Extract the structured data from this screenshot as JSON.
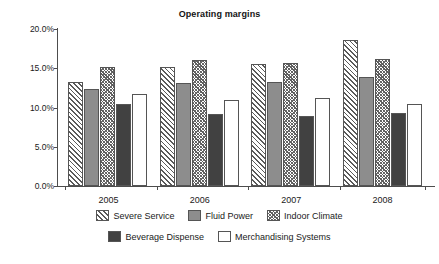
{
  "chart_data": {
    "type": "bar",
    "title": "Operating margins",
    "xlabel": "",
    "ylabel": "",
    "categories": [
      "2005",
      "2006",
      "2007",
      "2008"
    ],
    "ylim": [
      0,
      20
    ],
    "ytick_labels": [
      "0.0%",
      "5.0%",
      "10.0%",
      "15.0%",
      "20.0%"
    ],
    "ytick_values": [
      0,
      5,
      10,
      15,
      20
    ],
    "grid": false,
    "legend_position": "bottom",
    "series": [
      {
        "name": "Severe Service",
        "fill": "diagonal-hatch",
        "color": "#ffffff",
        "values": [
          13.3,
          15.1,
          15.6,
          18.6
        ]
      },
      {
        "name": "Fluid Power",
        "fill": "solid-medium-gray",
        "color": "#8d8d8d",
        "values": [
          12.3,
          13.1,
          13.3,
          13.9
        ]
      },
      {
        "name": "Indoor Climate",
        "fill": "dense-cross-hatch",
        "color": "#ffffff",
        "values": [
          15.1,
          16.1,
          15.7,
          16.2
        ]
      },
      {
        "name": "Beverage Dispense",
        "fill": "solid-dark-gray",
        "color": "#414141",
        "values": [
          10.4,
          9.2,
          8.9,
          9.3
        ]
      },
      {
        "name": "Merchandising Systems",
        "fill": "white",
        "color": "#ffffff",
        "values": [
          11.7,
          11.0,
          11.2,
          10.5
        ]
      }
    ]
  }
}
